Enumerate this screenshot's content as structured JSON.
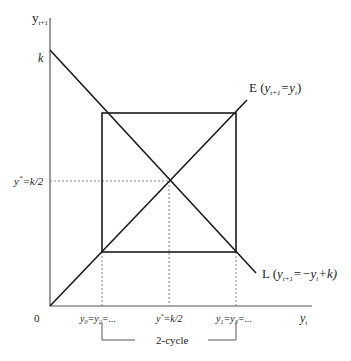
{
  "axes": {
    "y_label": "y",
    "y_label_sub": "t+1",
    "x_label": "y",
    "x_label_sub": "t",
    "origin_label": "0"
  },
  "y_ticks": {
    "k": "k",
    "ystar_base": "y",
    "ystar_sup": "*",
    "ystar_rest": "=k/2"
  },
  "x_ticks": {
    "left_a": "y",
    "left_a_sub": "0",
    "left_eq": "=y",
    "left_b_sub": "2",
    "left_tail": "=...",
    "mid_base": "y",
    "mid_sup": "*",
    "mid_rest": "=k/2",
    "right_a": "y",
    "right_a_sub": "1",
    "right_eq": "=y",
    "right_b_sub": "3",
    "right_tail": "=..."
  },
  "lines": {
    "E_name": "E (",
    "E_y": "y",
    "E_sub1": "t+1",
    "E_eq": "=y",
    "E_sub2": "t",
    "E_close": ")",
    "L_name": "L (",
    "L_y": "y",
    "L_sub1": "t+1",
    "L_eq": "=−y",
    "L_sub2": "t",
    "L_tail": "+k)"
  },
  "annotation": {
    "cycle_label": "2-cycle"
  },
  "colors": {
    "line": "#1a1a1a",
    "axis": "#555555",
    "dotted": "#888888"
  }
}
